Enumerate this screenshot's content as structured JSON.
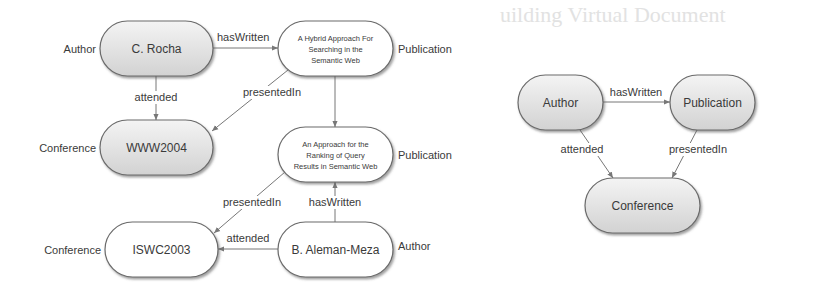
{
  "background_bleed_text": "uilding Virtual Document",
  "instance_graph": {
    "nodes": [
      {
        "id": "rocha",
        "label_lines": [
          "C. Rocha"
        ],
        "type": "Author",
        "style": "shaded"
      },
      {
        "id": "hybrid",
        "label_lines": [
          "A Hybrid Approach For",
          "Searching in the",
          "Semantic Web"
        ],
        "type": "Publication",
        "style": "plain"
      },
      {
        "id": "www2004",
        "label_lines": [
          "WWW2004"
        ],
        "type": "Conference",
        "style": "shaded"
      },
      {
        "id": "ranking",
        "label_lines": [
          "An Approach for the",
          "Ranking of Query",
          "Results in Semantic Web"
        ],
        "type": "Publication",
        "style": "plain"
      },
      {
        "id": "iswc2003",
        "label_lines": [
          "ISWC2003"
        ],
        "type": "Conference",
        "style": "plain"
      },
      {
        "id": "aleman",
        "label_lines": [
          "B. Aleman-Meza"
        ],
        "type": "Author",
        "style": "plain"
      }
    ],
    "edges": [
      {
        "from": "rocha",
        "to": "hybrid",
        "label": "hasWritten"
      },
      {
        "from": "rocha",
        "to": "www2004",
        "label": "attended"
      },
      {
        "from": "hybrid",
        "to": "www2004",
        "label": "presentedIn"
      },
      {
        "from": "hybrid",
        "to": "ranking",
        "label": ""
      },
      {
        "from": "ranking",
        "to": "iswc2003",
        "label": "presentedIn"
      },
      {
        "from": "aleman",
        "to": "ranking",
        "label": "hasWritten"
      },
      {
        "from": "aleman",
        "to": "iswc2003",
        "label": "attended"
      }
    ]
  },
  "schema_graph": {
    "nodes": [
      {
        "id": "s-author",
        "label_lines": [
          "Author"
        ],
        "style": "shaded"
      },
      {
        "id": "s-publication",
        "label_lines": [
          "Publication"
        ],
        "style": "shaded"
      },
      {
        "id": "s-conference",
        "label_lines": [
          "Conference"
        ],
        "style": "shaded"
      }
    ],
    "edges": [
      {
        "from": "s-author",
        "to": "s-publication",
        "label": "hasWritten"
      },
      {
        "from": "s-author",
        "to": "s-conference",
        "label": "attended"
      },
      {
        "from": "s-publication",
        "to": "s-conference",
        "label": "presentedIn"
      }
    ]
  },
  "colors": {
    "node_fill_light": "#f2f2f2",
    "node_fill_dark": "#d4d4d4",
    "node_stroke": "#6a6a6a",
    "edge": "#777777",
    "text": "#3a3a3a"
  }
}
